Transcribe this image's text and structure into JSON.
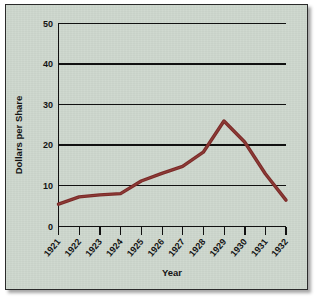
{
  "chart_data": {
    "type": "line",
    "title": "",
    "xlabel": "Year",
    "ylabel": "Dollars per Share",
    "categories": [
      "1921",
      "1922",
      "1923",
      "1924",
      "1925",
      "1926",
      "1927",
      "1928",
      "1929",
      "1930",
      "1931",
      "1932"
    ],
    "x": [
      1921,
      1922,
      1923,
      1924,
      1925,
      1926,
      1927,
      1928,
      1929,
      1930,
      1931,
      1932
    ],
    "values": [
      5.5,
      7.3,
      7.8,
      8.1,
      11.2,
      13.1,
      14.8,
      18.3,
      26.0,
      20.8,
      13.0,
      6.5
    ],
    "series": [
      {
        "name": "Dollars per Share",
        "color": "#7b2a28",
        "values": [
          5.5,
          7.3,
          7.8,
          8.1,
          11.2,
          13.1,
          14.8,
          18.3,
          26.0,
          20.8,
          13.0,
          6.5
        ]
      }
    ],
    "ylim": [
      0,
      50
    ],
    "yticks": [
      0,
      10,
      20,
      30,
      40,
      50
    ],
    "ytick_labels": [
      "0",
      "10",
      "20",
      "30",
      "40",
      "50"
    ],
    "xtick_labels": [
      "1921",
      "1922",
      "1923",
      "1924",
      "1925",
      "1926",
      "1927",
      "1928",
      "1929",
      "1930",
      "1931",
      "1932"
    ],
    "xtick_label_rotation": -50,
    "grid": true,
    "grid_axis": "y",
    "legend": false,
    "legend_position": "none",
    "annotations": []
  },
  "figure": {
    "background_color": "#ccd6cc",
    "border_color": "#2b2b2b",
    "axis_color": "#111111",
    "text_color": "#141414"
  }
}
